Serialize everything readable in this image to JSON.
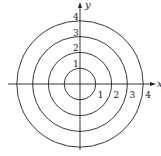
{
  "diagram": {
    "type": "polar-circles",
    "axes": {
      "x_label": "x",
      "y_label": "y"
    },
    "circles": [
      {
        "radius": 1,
        "x_label": "1",
        "y_label": "1"
      },
      {
        "radius": 2,
        "x_label": "2",
        "y_label": "2"
      },
      {
        "radius": 3,
        "x_label": "3",
        "y_label": "3"
      },
      {
        "radius": 4,
        "x_label": "4",
        "y_label": "4"
      }
    ],
    "stroke_color": "#222222"
  }
}
